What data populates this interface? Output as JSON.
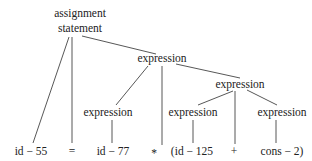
{
  "diagram": {
    "type": "parse-tree",
    "nodes": [
      {
        "id": "root",
        "label_lines": [
          "assignment",
          "statement"
        ],
        "kind": "nonterminal"
      },
      {
        "id": "expr_top",
        "label": "expression",
        "kind": "nonterminal"
      },
      {
        "id": "expr_left",
        "label": "expression",
        "kind": "nonterminal"
      },
      {
        "id": "expr_right",
        "label": "expression",
        "kind": "nonterminal"
      },
      {
        "id": "expr_rl",
        "label": "expression",
        "kind": "nonterminal"
      },
      {
        "id": "expr_rr",
        "label": "expression",
        "kind": "nonterminal"
      },
      {
        "id": "leaf_id55",
        "label": "id − 55",
        "kind": "terminal"
      },
      {
        "id": "leaf_eq",
        "label": "=",
        "kind": "terminal"
      },
      {
        "id": "leaf_id77",
        "label": "id − 77",
        "kind": "terminal"
      },
      {
        "id": "leaf_star",
        "label": "*",
        "kind": "terminal"
      },
      {
        "id": "leaf_id125",
        "label": "(id − 125",
        "kind": "terminal"
      },
      {
        "id": "leaf_plus",
        "label": "+",
        "kind": "terminal"
      },
      {
        "id": "leaf_cons2",
        "label": "cons − 2)",
        "kind": "terminal"
      }
    ],
    "edges": [
      {
        "from": "root",
        "to": "leaf_id55"
      },
      {
        "from": "root",
        "to": "leaf_eq"
      },
      {
        "from": "root",
        "to": "expr_top"
      },
      {
        "from": "expr_top",
        "to": "expr_left"
      },
      {
        "from": "expr_top",
        "to": "leaf_star"
      },
      {
        "from": "expr_top",
        "to": "expr_right"
      },
      {
        "from": "expr_left",
        "to": "leaf_id77"
      },
      {
        "from": "expr_right",
        "to": "expr_rl"
      },
      {
        "from": "expr_right",
        "to": "leaf_plus"
      },
      {
        "from": "expr_right",
        "to": "expr_rr"
      },
      {
        "from": "expr_rl",
        "to": "leaf_id125"
      },
      {
        "from": "expr_rr",
        "to": "leaf_cons2"
      }
    ]
  }
}
